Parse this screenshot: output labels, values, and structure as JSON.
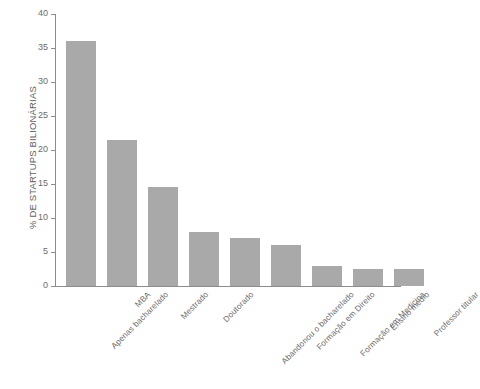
{
  "chart_data": {
    "type": "bar",
    "title": "",
    "xlabel": "",
    "ylabel": "% DE STARTUPS BILIONÁRIAS",
    "ylim": [
      0,
      40
    ],
    "yticks": [
      0,
      5,
      10,
      15,
      20,
      25,
      30,
      35,
      40
    ],
    "ytick_labels": [
      "0",
      "5",
      "10",
      "15",
      "20",
      "25",
      "30",
      "35",
      "40"
    ],
    "grid": false,
    "legend": "none",
    "bar_color": "#a9a9a9",
    "axis_color": "#8d8d8d",
    "background_color": "#ffffff",
    "categories": [
      "Apenas bacharelado",
      "MBA",
      "Mestrado",
      "Doutorado",
      "Abandonou o bacharelado",
      "Formação em Direito",
      "Formação em Medicina",
      "Ensino médio",
      "Professor titular"
    ],
    "values": [
      36,
      21.5,
      14.5,
      8,
      7,
      6,
      3,
      2.5,
      2.5
    ]
  }
}
